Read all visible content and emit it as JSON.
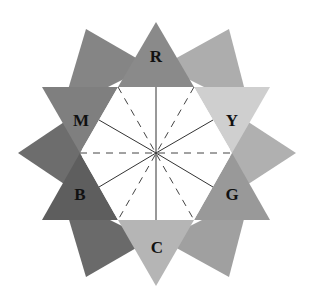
{
  "diagram": {
    "title": "",
    "center": [
      156,
      153
    ],
    "hexagon": {
      "fill": "#ffffff",
      "points": [
        [
          80,
          153
        ],
        [
          118,
          87
        ],
        [
          194,
          87
        ],
        [
          232,
          153
        ],
        [
          194,
          220
        ],
        [
          118,
          220
        ]
      ]
    },
    "corner_triangles": [
      {
        "name": "top-left",
        "color": "#858585",
        "points": [
          [
            86,
            29
          ],
          [
            150,
            66
          ],
          [
            62,
            110
          ]
        ]
      },
      {
        "name": "top-right",
        "color": "#adadad",
        "points": [
          [
            229,
            29
          ],
          [
            250,
            110
          ],
          [
            162,
            66
          ]
        ]
      },
      {
        "name": "right",
        "color": "#b0b0b0",
        "points": [
          [
            296,
            153
          ],
          [
            230,
            196
          ],
          [
            230,
            110
          ]
        ]
      },
      {
        "name": "bottom-right",
        "color": "#a0a0a0",
        "points": [
          [
            229,
            277
          ],
          [
            162,
            240
          ],
          [
            250,
            196
          ]
        ]
      },
      {
        "name": "bottom-left",
        "color": "#6a6a6a",
        "points": [
          [
            86,
            277
          ],
          [
            62,
            196
          ],
          [
            150,
            240
          ]
        ]
      },
      {
        "name": "left",
        "color": "#6d6d6d",
        "points": [
          [
            18,
            153
          ],
          [
            82,
            110
          ],
          [
            82,
            196
          ]
        ]
      }
    ],
    "label_triangles": [
      {
        "label": "R",
        "color": "#8a8a8a",
        "points": [
          [
            156,
            22
          ],
          [
            194,
            87
          ],
          [
            118,
            87
          ]
        ],
        "text_pos": [
          156,
          56
        ]
      },
      {
        "label": "Y",
        "color": "#cfcfcf",
        "points": [
          [
            270,
            87
          ],
          [
            232,
            153
          ],
          [
            194,
            87
          ]
        ],
        "text_pos": [
          232,
          120
        ]
      },
      {
        "label": "G",
        "color": "#999999",
        "points": [
          [
            270,
            220
          ],
          [
            194,
            220
          ],
          [
            232,
            153
          ]
        ],
        "text_pos": [
          232,
          194
        ]
      },
      {
        "label": "C",
        "color": "#b5b5b5",
        "points": [
          [
            156,
            286
          ],
          [
            118,
            220
          ],
          [
            194,
            220
          ]
        ],
        "text_pos": [
          157,
          247
        ]
      },
      {
        "label": "B",
        "color": "#5e5e5e",
        "points": [
          [
            42,
            220
          ],
          [
            80,
            153
          ],
          [
            118,
            220
          ]
        ],
        "text_pos": [
          80,
          194
        ]
      },
      {
        "label": "M",
        "color": "#7f7f7f",
        "points": [
          [
            42,
            87
          ],
          [
            118,
            87
          ],
          [
            80,
            153
          ]
        ],
        "text_pos": [
          81,
          120
        ]
      }
    ],
    "solid_lines": [
      [
        [
          156,
          153
        ],
        [
          156,
          87
        ]
      ],
      [
        [
          156,
          153
        ],
        [
          156,
          220
        ]
      ],
      [
        [
          156,
          153
        ],
        [
          213,
          120
        ]
      ],
      [
        [
          156,
          153
        ],
        [
          99,
          120
        ]
      ],
      [
        [
          156,
          153
        ],
        [
          213,
          187
        ]
      ],
      [
        [
          156,
          153
        ],
        [
          99,
          187
        ]
      ]
    ],
    "dashed_lines": [
      [
        [
          80,
          153
        ],
        [
          232,
          153
        ]
      ],
      [
        [
          118,
          87
        ],
        [
          194,
          220
        ]
      ],
      [
        [
          194,
          87
        ],
        [
          118,
          220
        ]
      ]
    ]
  }
}
